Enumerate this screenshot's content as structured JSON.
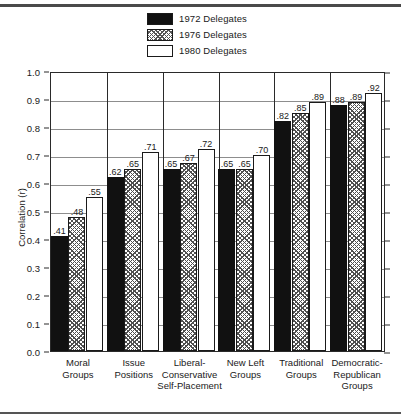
{
  "chart_data": {
    "type": "bar",
    "title": "",
    "xlabel": "",
    "ylabel": "Correlation (r)",
    "ylim": [
      0.0,
      1.0
    ],
    "ytick_labels": [
      "0.0",
      "0.1",
      "0.2",
      "0.3",
      "0.4",
      "0.5",
      "0.6",
      "0.7",
      "0.8",
      "0.9",
      "1.0"
    ],
    "ytick_values": [
      0.0,
      0.1,
      0.2,
      0.3,
      0.4,
      0.5,
      0.6,
      0.7,
      0.8,
      0.9,
      1.0
    ],
    "grid": true,
    "legend_position": "top-center",
    "categories": [
      "Moral\nGroups",
      "Issue\nPositions",
      "Liberal-\nConservative\nSelf-Placement",
      "New Left\nGroups",
      "Traditional\nGroups",
      "Democratic-\nRepublican\nGroups"
    ],
    "series": [
      {
        "name": "1972 Delegates",
        "fill": "solid-black",
        "values": [
          0.41,
          0.62,
          0.65,
          0.65,
          0.82,
          0.88
        ],
        "labels": [
          ".41",
          ".62",
          ".65",
          ".65",
          ".82",
          ".88"
        ]
      },
      {
        "name": "1976 Delegates",
        "fill": "hatched",
        "values": [
          0.48,
          0.65,
          0.67,
          0.65,
          0.85,
          0.89
        ],
        "labels": [
          ".48",
          ".65",
          ".67",
          ".65",
          ".85",
          ".89"
        ]
      },
      {
        "name": "1980 Delegates",
        "fill": "open-white",
        "values": [
          0.55,
          0.71,
          0.72,
          0.7,
          0.89,
          0.92
        ],
        "labels": [
          ".55",
          ".71",
          ".72",
          ".70",
          ".89",
          ".92"
        ]
      }
    ]
  },
  "legend": {
    "items": [
      {
        "label": "1972 Delegates",
        "swatch": "solid-black-swatch"
      },
      {
        "label": "1976 Delegates",
        "swatch": "hatched-swatch"
      },
      {
        "label": "1980 Delegates",
        "swatch": "open-white-swatch"
      }
    ]
  },
  "colors": {
    "series_1972": "#111111",
    "series_1976_hatch": "#4f4f4f",
    "series_1980": "#ffffff",
    "axis": "#2a2a2a",
    "gridline": "#8d8d8d",
    "background": "#ffffff"
  }
}
